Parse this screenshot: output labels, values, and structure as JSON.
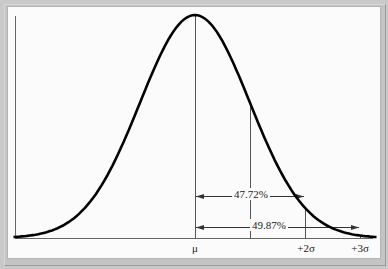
{
  "chart_data": {
    "type": "line",
    "title": "",
    "xlabel": "",
    "ylabel": "",
    "x_ticks": [
      "μ",
      "+2σ",
      "+3σ"
    ],
    "x_tick_positions_sigma": [
      0,
      2,
      3
    ],
    "vertical_markers_sigma": [
      0,
      1,
      2,
      3
    ],
    "annotations": [
      {
        "label": "47.72%",
        "from_sigma": 0,
        "to_sigma": 2,
        "meaning": "area between μ and +2σ"
      },
      {
        "label": "49.87%",
        "from_sigma": 0,
        "to_sigma": 3,
        "meaning": "area between μ and +3σ"
      }
    ],
    "series": [
      {
        "name": "normal pdf",
        "x_range_sigma": [
          -3.3,
          3.3
        ]
      }
    ],
    "grid": false,
    "legend": null
  },
  "labels": {
    "mu": "μ",
    "plus2sigma": "+2σ",
    "plus3sigma": "+3σ",
    "pct_2sigma": "47.72%",
    "pct_3sigma": "49.87%"
  },
  "colors": {
    "curve": "#000000",
    "lines": "#555555",
    "background": "#fbfbfb",
    "frame": "#c6c6c6"
  }
}
